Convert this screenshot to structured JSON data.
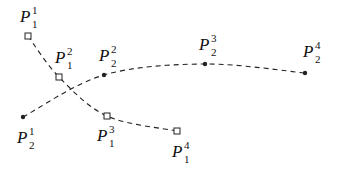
{
  "diagram": {
    "title": "",
    "base_letter": "P",
    "colors": {
      "stroke": "#222222",
      "background": "#ffffff"
    },
    "paths": [
      {
        "id": "path1",
        "marker": "square",
        "style": "dashed",
        "points": [
          {
            "name": "P_1^1",
            "sup": "1",
            "sub": "1",
            "x": 28,
            "y": 36,
            "label_x": 20,
            "label_y": 22
          },
          {
            "name": "P_1^2",
            "sup": "2",
            "sub": "1",
            "x": 59,
            "y": 77,
            "label_x": 55,
            "label_y": 63
          },
          {
            "name": "P_1^3",
            "sup": "3",
            "sub": "1",
            "x": 107,
            "y": 116,
            "label_x": 97,
            "label_y": 141
          },
          {
            "name": "P_1^4",
            "sup": "4",
            "sub": "1",
            "x": 177,
            "y": 131,
            "label_x": 172,
            "label_y": 157
          }
        ]
      },
      {
        "id": "path2",
        "marker": "dot",
        "style": "dashed",
        "points": [
          {
            "name": "P_2^1",
            "sup": "1",
            "sub": "2",
            "x": 23,
            "y": 117,
            "label_x": 17,
            "label_y": 143
          },
          {
            "name": "P_2^2",
            "sup": "2",
            "sub": "2",
            "x": 104,
            "y": 75,
            "label_x": 99,
            "label_y": 61
          },
          {
            "name": "P_2^3",
            "sup": "3",
            "sub": "2",
            "x": 205,
            "y": 64,
            "label_x": 199,
            "label_y": 50
          },
          {
            "name": "P_2^4",
            "sup": "4",
            "sub": "2",
            "x": 305,
            "y": 73,
            "label_x": 303,
            "label_y": 57
          }
        ]
      }
    ]
  }
}
